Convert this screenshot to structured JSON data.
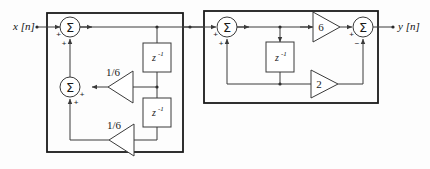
{
  "figure": {
    "type": "block-diagram",
    "input_label": "x [n]",
    "output_label": "y [n]"
  },
  "stage1": {
    "name": "left-subsystem",
    "adders": [
      {
        "id": "adder-1",
        "symbol": "Σ",
        "inputs": [
          {
            "port": "left",
            "sign": "+"
          },
          {
            "port": "bottom",
            "sign": "+"
          }
        ]
      },
      {
        "id": "adder-2",
        "symbol": "Σ",
        "inputs": [
          {
            "port": "right",
            "sign": "+"
          },
          {
            "port": "bottom",
            "sign": "+"
          }
        ]
      }
    ],
    "gains": [
      {
        "id": "gain-upper",
        "label": "1/6",
        "direction": "left"
      },
      {
        "id": "gain-lower",
        "label": "1/6",
        "direction": "left"
      }
    ],
    "delays": [
      {
        "id": "delay-1",
        "base": "z",
        "exponent": "-1"
      },
      {
        "id": "delay-2",
        "base": "z",
        "exponent": "-1"
      }
    ]
  },
  "stage2": {
    "name": "right-subsystem",
    "adders": [
      {
        "id": "adder-3",
        "symbol": "Σ",
        "inputs": [
          {
            "port": "left",
            "sign": "+"
          },
          {
            "port": "bottom",
            "sign": "+"
          }
        ]
      },
      {
        "id": "adder-4",
        "symbol": "Σ",
        "inputs": [
          {
            "port": "left",
            "sign": "+"
          },
          {
            "port": "bottom",
            "sign": "−"
          }
        ]
      }
    ],
    "gains": [
      {
        "id": "gain-six",
        "label": "6",
        "direction": "right"
      },
      {
        "id": "gain-two",
        "label": "2",
        "direction": "right"
      }
    ],
    "delays": [
      {
        "id": "delay-3",
        "base": "z",
        "exponent": "-1"
      }
    ]
  },
  "colors": {
    "wire": "#3a3a3a",
    "outline": "#1a1a1a",
    "text": "#111111",
    "background": "#fdfdfd"
  }
}
